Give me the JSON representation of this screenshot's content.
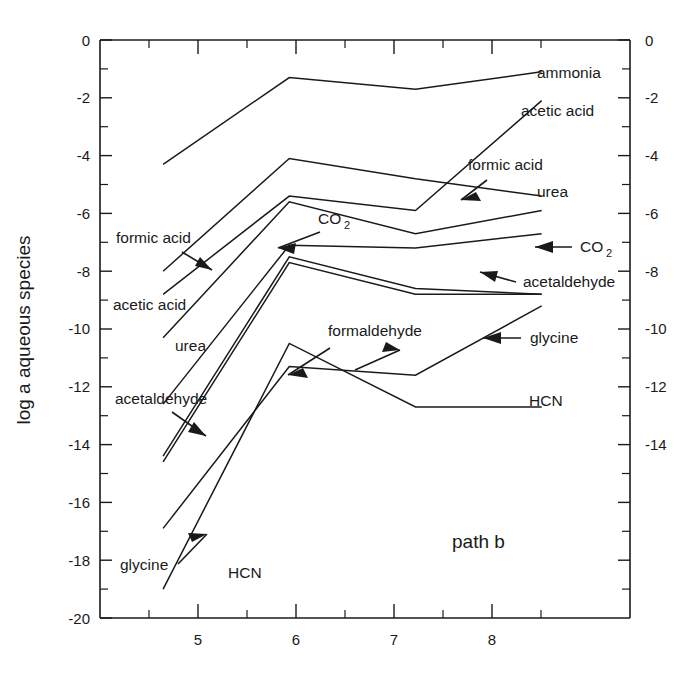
{
  "figure": {
    "panel_tag": "path b",
    "y_axis_title": "log a aqueous species",
    "background_color": "#ffffff",
    "line_color": "#1a1a1a"
  },
  "chart_data": {
    "type": "line",
    "title": "",
    "subtitle": "",
    "panel_label": "path b",
    "xlabel": "",
    "ylabel": "log a aqueous species",
    "xlim": [
      4.5,
      8.7
    ],
    "ylim": [
      -20,
      0
    ],
    "grid": false,
    "legend": "inline-annotations",
    "x_ticks_major": [
      5,
      6,
      7,
      8
    ],
    "x_ticks_minor": [
      4.5,
      5.5,
      6.5,
      7.5,
      8.5
    ],
    "x_tick_labels": [
      "5",
      "6",
      "7",
      "8"
    ],
    "y_ticks_major": [
      0,
      -2,
      -4,
      -6,
      -8,
      -10,
      -12,
      -14,
      -16,
      -18,
      -20
    ],
    "y_tick_labels": [
      "0",
      "-2",
      "-4",
      "-6",
      "-8",
      "-10",
      "-12",
      "-14",
      "-16",
      "-18",
      "-20"
    ],
    "y_ticks_minor": [
      -1,
      -3,
      -5,
      -7,
      -9,
      -11,
      -13,
      -15,
      -17,
      -19
    ],
    "right_axis_ticks": [
      0,
      -2,
      -4,
      -6,
      -8,
      -10,
      -12,
      -14
    ],
    "right_axis_tick_labels": [
      "0",
      "-2",
      "-4",
      "-6",
      "-8",
      "-10",
      "-12",
      "-14"
    ],
    "x": [
      5,
      6,
      7,
      8
    ],
    "series": [
      {
        "name": "ammonia",
        "x": [
          5,
          6,
          7,
          8
        ],
        "values": [
          -4.3,
          -1.3,
          -1.7,
          -1.1
        ]
      },
      {
        "name": "acetic acid",
        "x": [
          5,
          6,
          7,
          8
        ],
        "values": [
          -8.8,
          -5.4,
          -5.9,
          -2.1
        ]
      },
      {
        "name": "formic acid",
        "x": [
          5,
          6,
          7,
          8
        ],
        "values": [
          -8.0,
          -4.1,
          -4.8,
          -5.4
        ]
      },
      {
        "name": "urea",
        "x": [
          5,
          6,
          7,
          8
        ],
        "values": [
          -10.3,
          -5.6,
          -6.7,
          -5.9
        ]
      },
      {
        "name": "CO2",
        "x": [
          5,
          6,
          7,
          8
        ],
        "values": [
          -12.6,
          -7.1,
          -7.2,
          -6.7
        ]
      },
      {
        "name": "acetaldehyde",
        "x": [
          5,
          6,
          7,
          8
        ],
        "values": [
          -14.4,
          -7.5,
          -8.6,
          -8.8
        ]
      },
      {
        "name": "formaldehyde",
        "x": [
          5,
          6,
          7,
          8
        ],
        "values": [
          -14.6,
          -7.7,
          -8.8,
          -8.8
        ]
      },
      {
        "name": "glycine",
        "x": [
          5,
          6,
          7,
          8
        ],
        "values": [
          -16.9,
          -11.3,
          -11.6,
          -9.2
        ]
      },
      {
        "name": "HCN",
        "x": [
          5,
          6,
          7,
          8
        ],
        "values": [
          -19.0,
          -10.5,
          -12.7,
          -12.7
        ]
      }
    ],
    "annotations": [
      {
        "label": "formic acid",
        "side": "left",
        "text_x": 116,
        "text_y": 243
      },
      {
        "label": "acetic acid",
        "side": "left",
        "text_x": 113,
        "text_y": 310
      },
      {
        "label": "urea",
        "side": "left",
        "text_x": 175,
        "text_y": 351
      },
      {
        "label": "acetaldehyde",
        "side": "left",
        "text_x": 115,
        "text_y": 404
      },
      {
        "label": "glycine",
        "side": "left",
        "text_x": 120,
        "text_y": 570
      },
      {
        "label": "HCN",
        "side": "left",
        "text_x": 228,
        "text_y": 578
      },
      {
        "label": "CO",
        "side": "inner",
        "text_x": 318,
        "text_y": 224
      },
      {
        "label": "formaldehyde",
        "side": "inner",
        "text_x": 328,
        "text_y": 336
      },
      {
        "label": "ammonia",
        "side": "right",
        "text_x": 537,
        "text_y": 78
      },
      {
        "label": "acetic acid",
        "side": "right",
        "text_x": 521,
        "text_y": 116
      },
      {
        "label": "formic acid",
        "side": "right",
        "text_x": 468,
        "text_y": 170
      },
      {
        "label": "urea",
        "side": "right",
        "text_x": 537,
        "text_y": 197
      },
      {
        "label": "CO",
        "side": "right",
        "text_x": 580,
        "text_y": 252
      },
      {
        "label": "acetaldehyde",
        "side": "right",
        "text_x": 523,
        "text_y": 287
      },
      {
        "label": "glycine",
        "side": "right",
        "text_x": 530,
        "text_y": 343
      },
      {
        "label": "HCN",
        "side": "right",
        "text_x": 529,
        "text_y": 406
      }
    ]
  }
}
